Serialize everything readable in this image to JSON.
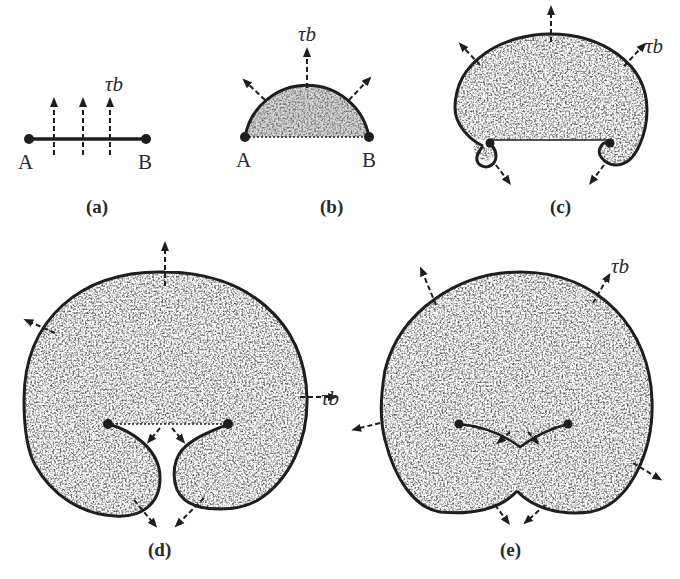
{
  "figure": {
    "panels": [
      {
        "id": "a",
        "caption": "(a)",
        "endpoint_left": "A",
        "endpoint_right": "B",
        "stress_label": "τb",
        "description": "Pinned straight dislocation segment A–B with resolved shear stress arrows"
      },
      {
        "id": "b",
        "caption": "(b)",
        "endpoint_left": "A",
        "endpoint_right": "B",
        "stress_label": "τb",
        "description": "Segment bows out into semicircle"
      },
      {
        "id": "c",
        "caption": "(c)",
        "stress_label": "τb",
        "description": "Loop expands beyond semicircle, curling around pinning points"
      },
      {
        "id": "d",
        "caption": "(d)",
        "stress_label": "τb",
        "description": "Two lobes approach each other beneath pinning points"
      },
      {
        "id": "e",
        "caption": "(e)",
        "stress_label_right": "τb",
        "stress_label_left": "τb",
        "description": "Lobes meet and annihilate, forming closed loop and regenerated segment"
      }
    ]
  },
  "colors": {
    "line": "#1e1e1e",
    "fill": "#5a5a5a",
    "background": "#ffffff"
  }
}
